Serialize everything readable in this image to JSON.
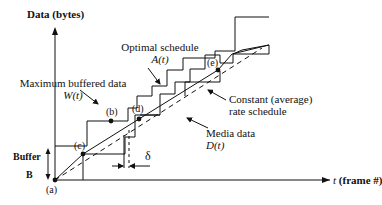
{
  "axes": {
    "y_label": "Data (bytes)",
    "x_label_var": "t",
    "x_label_rest": "(frame #)"
  },
  "annotations": {
    "optimal_schedule": {
      "line1": "Optimal schedule",
      "line2": "A(t)"
    },
    "max_buffered": {
      "line1": "Maximum buffered data",
      "line2": "W(t)"
    },
    "constant_rate": {
      "line1": "Constant (average)",
      "line2": "rate schedule"
    },
    "media_data": {
      "line1": "Media data",
      "line2": "D(t)"
    },
    "buffer": {
      "line1": "Buffer",
      "line2": "B"
    },
    "delta": "δ"
  },
  "points": {
    "a": "(a)",
    "b": "(b)",
    "c": "(c)",
    "d": "(d)",
    "e": "(e)"
  },
  "colors": {
    "line": "#111111",
    "background": "#ffffff"
  }
}
